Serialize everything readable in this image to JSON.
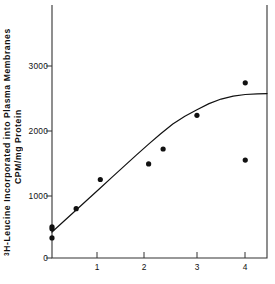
{
  "chart_data": {
    "type": "scatter",
    "title": "",
    "subtitle": "",
    "ylabel_line1": "H-Leucine Incorporated into Plasma Membranes",
    "ylabel_line1_superscript": "3",
    "ylabel_line2": "CPM/mg Protein",
    "xlabel": "",
    "xlim": [
      0,
      4.45
    ],
    "ylim": [
      0,
      3900
    ],
    "grid": false,
    "legend": null,
    "yticks": [
      0,
      1000,
      2000,
      3000
    ],
    "ytick_labels": [
      "0",
      "1000",
      "2000",
      "3000"
    ],
    "xticks": [
      1,
      2,
      3,
      4
    ],
    "xtick_labels": [
      "1",
      "2",
      "3",
      "4"
    ],
    "series": [
      {
        "name": "data points",
        "marker": "filled-circle",
        "color": "#111111",
        "x": [
          0.0,
          0.0,
          0.0,
          0.5,
          1.0,
          2.0,
          2.3,
          3.0,
          4.0,
          4.0
        ],
        "y": [
          480,
          450,
          310,
          760,
          1210,
          1450,
          1680,
          2200,
          2700,
          1510
        ]
      },
      {
        "name": "fitted curve",
        "marker": "none",
        "line": "solid",
        "color": "#111111",
        "x": [
          0.0,
          0.25,
          0.5,
          0.75,
          1.0,
          1.25,
          1.5,
          1.75,
          2.0,
          2.25,
          2.5,
          2.75,
          3.0,
          3.25,
          3.5,
          3.75,
          4.0,
          4.25,
          4.45
        ],
        "y": [
          400,
          570,
          740,
          910,
          1080,
          1250,
          1420,
          1590,
          1755,
          1915,
          2065,
          2185,
          2285,
          2380,
          2450,
          2495,
          2520,
          2530,
          2535
        ]
      }
    ]
  },
  "axes": {
    "frame_color": "#333333"
  }
}
